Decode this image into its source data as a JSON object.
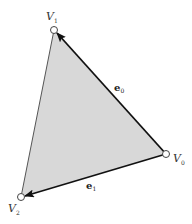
{
  "diagram": {
    "colors": {
      "fill": "#d8d8d8",
      "edge": "#111111",
      "thin_edge": "#555555",
      "vertex_stroke": "#444444",
      "vertex_fill": "#ffffff"
    },
    "vertices": [
      {
        "id": "V0",
        "label": "V",
        "subscript": "0",
        "x": 166,
        "y": 154
      },
      {
        "id": "V1",
        "label": "V",
        "subscript": "1",
        "x": 54,
        "y": 30
      },
      {
        "id": "V2",
        "label": "V",
        "subscript": "2",
        "x": 21,
        "y": 197
      }
    ],
    "edges": [
      {
        "id": "e0",
        "label": "e",
        "subscript": "0",
        "from": "V0",
        "to": "V1",
        "arrow": true
      },
      {
        "id": "e1",
        "label": "e",
        "subscript": "1",
        "from": "V0",
        "to": "V2",
        "arrow": true
      },
      {
        "id": "side",
        "from": "V1",
        "to": "V2",
        "arrow": false
      }
    ]
  }
}
